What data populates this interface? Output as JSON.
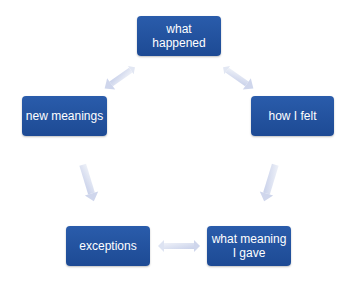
{
  "diagram": {
    "nodes": {
      "what_happened": "what\nhappened",
      "new_meanings": "new meanings",
      "how_i_felt": "how I felt",
      "exceptions": "exceptions",
      "what_meaning_i_gave": "what meaning\nI gave"
    },
    "edges": [
      {
        "from": "what happened",
        "to": "new meanings",
        "style": "double-arrow"
      },
      {
        "from": "what happened",
        "to": "how I felt",
        "style": "double-arrow"
      },
      {
        "from": "new meanings",
        "to": "exceptions",
        "style": "arrow"
      },
      {
        "from": "how I felt",
        "to": "what meaning I gave",
        "style": "arrow"
      },
      {
        "from": "exceptions",
        "to": "what meaning I gave",
        "style": "double-arrow"
      }
    ],
    "colors": {
      "node_fill": "#1f4e9c",
      "node_text": "#ffffff",
      "arrow_fill": "#d6dcef"
    }
  }
}
